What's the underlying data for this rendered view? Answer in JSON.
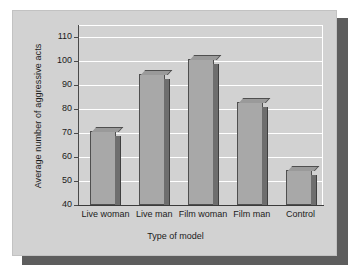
{
  "chart_data": {
    "type": "bar",
    "title": "",
    "categories": [
      "Live woman",
      "Live man",
      "Film woman",
      "Film man",
      "Control"
    ],
    "values": [
      71,
      94.5,
      101,
      83,
      54.5
    ],
    "series": [
      {
        "name": "Average number of aggressive acts",
        "values": [
          71,
          94.5,
          101,
          83,
          54.5
        ]
      }
    ],
    "xlabel": "Type of model",
    "ylabel": "Average number of aggressive acts",
    "ylim": [
      40,
      115
    ],
    "yticks": [
      40,
      50,
      60,
      70,
      80,
      90,
      100,
      110
    ],
    "ytick_labels": [
      "40",
      "50",
      "60",
      "70",
      "80",
      "90",
      "100",
      "110"
    ],
    "grid": true,
    "gridline_color": "#ffffff",
    "legend": null,
    "bar_color": "#a8a8a8",
    "bar_edge_color": "#4f4f4f",
    "bar_side_color": "#6e6e6e",
    "plot_background": "#d2d2d2",
    "panel_background": "#d2d2d2",
    "shadow_color": "#5d5d5d",
    "text_color": "#1b1b1b"
  }
}
